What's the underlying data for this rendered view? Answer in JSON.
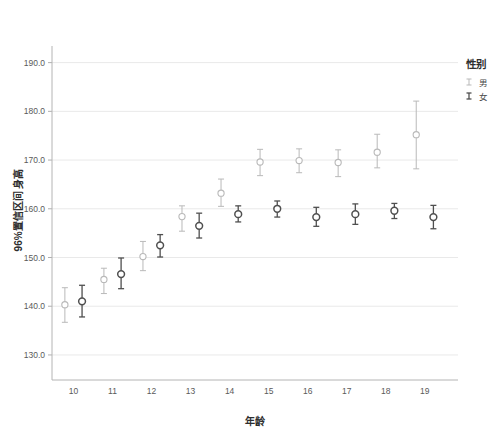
{
  "chart_data": {
    "type": "scatter",
    "title": "",
    "xlabel": "年龄",
    "ylabel": "96%置信区间 身高",
    "x": [
      10,
      11,
      12,
      13,
      14,
      15,
      16,
      17,
      18,
      19
    ],
    "xtick_labels": [
      "10",
      "11",
      "12",
      "13",
      "14",
      "15",
      "16",
      "17",
      "18",
      "19"
    ],
    "ytick_labels": [
      "130.0",
      "140.0",
      "150.0",
      "160.0",
      "170.0",
      "180.0",
      "190.0"
    ],
    "ytick_values": [
      130.0,
      140.0,
      150.0,
      160.0,
      170.0,
      180.0,
      190.0
    ],
    "ylim": [
      126.5,
      193.0
    ],
    "xlim": [
      9.45,
      19.85
    ],
    "grid": true,
    "legend_position": "right",
    "series": [
      {
        "name": "男",
        "color": "#b9b9b9",
        "offset": -0.22,
        "values": [
          140.3,
          145.5,
          150.2,
          158.4,
          163.2,
          169.6,
          169.9,
          169.5,
          171.6,
          175.2
        ],
        "ci_low": [
          136.7,
          142.6,
          147.3,
          155.4,
          160.5,
          166.8,
          167.4,
          166.6,
          168.4,
          168.2
        ],
        "ci_high": [
          143.8,
          147.8,
          153.3,
          160.6,
          166.1,
          172.2,
          172.3,
          172.1,
          175.3,
          182.1
        ]
      },
      {
        "name": "女",
        "color": "#4f4f4f",
        "offset": 0.22,
        "values": [
          141.0,
          146.6,
          152.5,
          156.5,
          158.9,
          160.0,
          158.3,
          158.9,
          159.6,
          158.3
        ],
        "ci_low": [
          137.8,
          143.6,
          150.1,
          154.0,
          157.3,
          158.3,
          156.4,
          156.8,
          158.0,
          155.9
        ],
        "ci_high": [
          144.3,
          149.9,
          154.7,
          159.1,
          160.6,
          161.6,
          160.3,
          161.0,
          161.1,
          160.7
        ]
      }
    ]
  },
  "legend": {
    "title": "性别",
    "items": [
      {
        "label": "男",
        "color": "#b9b9b9"
      },
      {
        "label": "女",
        "color": "#4f4f4f"
      }
    ]
  }
}
